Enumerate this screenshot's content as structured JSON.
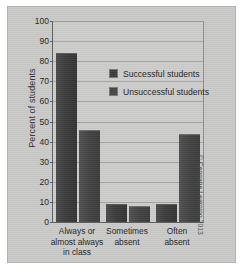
{
  "chart_data": {
    "type": "bar",
    "title": "",
    "xlabel": "",
    "ylabel": "Percent of students",
    "ylim": [
      0,
      100
    ],
    "ytick_step": 10,
    "yticks": [
      100,
      90,
      80,
      70,
      60,
      50,
      40,
      30,
      20,
      10,
      0
    ],
    "grid": true,
    "legend_position": "inside upper-right",
    "categories": [
      "Always or almost always in class",
      "Sometimes absent",
      "Often absent"
    ],
    "category_lines": [
      [
        "Always or",
        "almost always",
        "in class"
      ],
      [
        "Sometimes",
        "absent"
      ],
      [
        "Often",
        "absent"
      ]
    ],
    "series": [
      {
        "name": "Successful students",
        "values": [
          84,
          9,
          9
        ],
        "color": "#3b3b3b"
      },
      {
        "name": "Unsuccessful students",
        "values": [
          46,
          8,
          44
        ],
        "color": "#454545"
      }
    ]
  },
  "credit": "© Cengage Learning 2013",
  "colors": {
    "panel": "#c9c9c7",
    "plot_background": "#ccccca",
    "gridline": "#a3a3a1",
    "axis": "#5f5f5f",
    "series_1": "#3b3b3b",
    "series_2": "#454545",
    "text": "#1f1f1f"
  }
}
